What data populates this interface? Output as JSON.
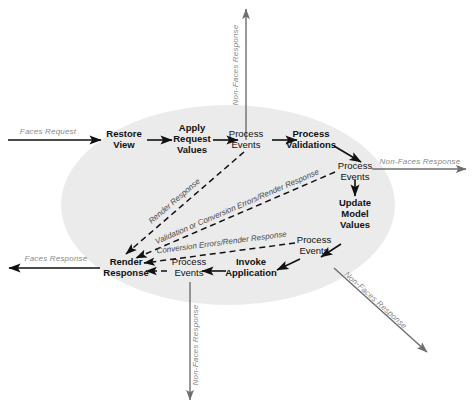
{
  "diagram": {
    "background_color": "#ffffff",
    "ellipse_color": "#ebebeb",
    "line_color": "#111111",
    "gray_label_color": "#8a8a8a",
    "dashed_label_color": "#4a4a4a"
  },
  "phases": {
    "restore_view": "Restore\nView",
    "restore_view_l1": "Restore",
    "restore_view_l2": "View",
    "apply_request_values_l1": "Apply",
    "apply_request_values_l2": "Request",
    "apply_request_values_l3": "Values",
    "process_events_1_l1": "Process",
    "process_events_1_l2": "Events",
    "process_validations_l1": "Process",
    "process_validations_l2": "Validations",
    "process_events_2_l1": "Process",
    "process_events_2_l2": "Events",
    "update_model_values_l1": "Update",
    "update_model_values_l2": "Model",
    "update_model_values_l3": "Values",
    "process_events_3_l1": "Process",
    "process_events_3_l2": "Events",
    "invoke_application_l1": "Invoke",
    "invoke_application_l2": "Application",
    "process_events_4_l1": "Process",
    "process_events_4_l2": "Events",
    "render_response_l1": "Render",
    "render_response_l2": "Response"
  },
  "edges": {
    "faces_request": "Faces Request",
    "faces_response": "Faces Response",
    "non_faces_response_top": "Non-Faces Response",
    "non_faces_response_right": "Non-Faces Response",
    "non_faces_response_bottom": "Non-Faces Response",
    "non_faces_response_diagonal": "Non-Faces Response",
    "render_response_dashed": "Render Response",
    "validation_or_conversion_errors": "Validation or Conversion Errors/Render Response",
    "conversion_errors_render_response": "Conversion Errors/Render Response"
  }
}
